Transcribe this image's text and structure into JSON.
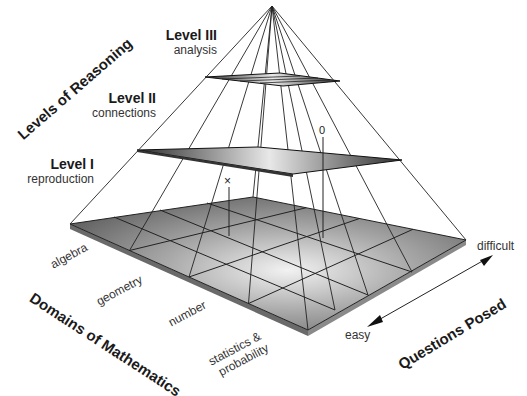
{
  "diagram": {
    "axes": {
      "reasoning": "Levels of Reasoning",
      "domains": "Domains of Mathematics",
      "questions": "Questions Posed"
    },
    "levels": [
      {
        "title": "Level III",
        "subtitle": "analysis"
      },
      {
        "title": "Level II",
        "subtitle": "connections"
      },
      {
        "title": "Level I",
        "subtitle": "reproduction"
      }
    ],
    "domains": [
      "algebra",
      "geometry",
      "number",
      "statistics &",
      "probability"
    ],
    "difficulty": {
      "high": "difficult",
      "low": "easy"
    },
    "markers": {
      "x": "×",
      "o": "0"
    },
    "colors": {
      "base_dark": "#4a4a4a",
      "base_light": "#d8d8d8",
      "line": "#222222"
    }
  }
}
